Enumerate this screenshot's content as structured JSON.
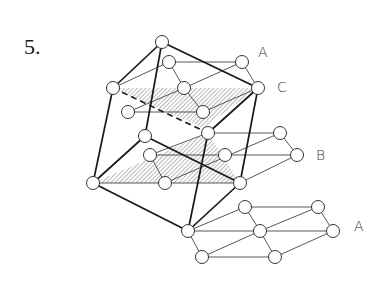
{
  "figure": {
    "number": "5.",
    "layer_labels": [
      {
        "id": "top-A",
        "text": "A",
        "x": 258,
        "y": 46
      },
      {
        "id": "C",
        "text": "C",
        "x": 277,
        "y": 80
      },
      {
        "id": "B",
        "text": "B",
        "x": 316,
        "y": 148
      },
      {
        "id": "bottom-A",
        "text": "A",
        "x": 354,
        "y": 219
      }
    ],
    "colors": {
      "line": "#1a1a1a",
      "thin": "#444444",
      "hatch": "#9a9a9a",
      "atom_fill": "#ffffff"
    }
  }
}
